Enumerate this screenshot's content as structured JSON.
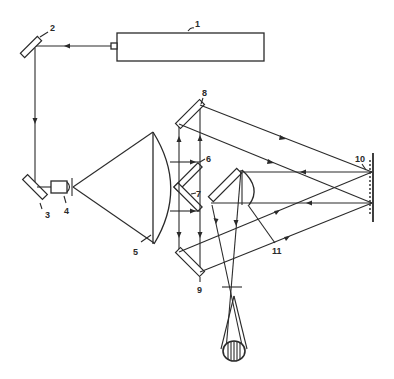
{
  "diagram": {
    "type": "optical schematic",
    "colors": {
      "ink": "#2a2a2a",
      "background": "#ffffff"
    },
    "labels": [
      {
        "id": "1",
        "text": "1",
        "component": "laser"
      },
      {
        "id": "2",
        "text": "2",
        "component": "mirror"
      },
      {
        "id": "3",
        "text": "3",
        "component": "mirror"
      },
      {
        "id": "4",
        "text": "4",
        "component": "microscope objective / pinhole"
      },
      {
        "id": "5",
        "text": "5",
        "component": "collimating lens"
      },
      {
        "id": "6",
        "text": "6",
        "component": "beam-splitting mirror"
      },
      {
        "id": "7",
        "text": "7",
        "component": "beam-splitting mirror"
      },
      {
        "id": "8",
        "text": "8",
        "component": "mirror"
      },
      {
        "id": "9",
        "text": "9",
        "component": "mirror"
      },
      {
        "id": "10",
        "text": "10",
        "component": "grating / object"
      },
      {
        "id": "11",
        "text": "11",
        "component": "lens"
      }
    ]
  }
}
